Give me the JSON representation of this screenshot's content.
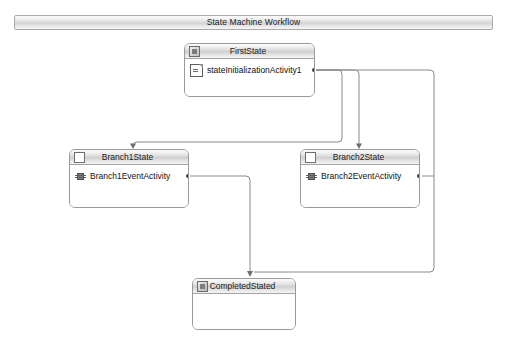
{
  "workflow": {
    "title": "State Machine Workflow",
    "designer_background": "#ffffff",
    "chrome_border": "#a9a9a9",
    "connector_color": "#8a8a8a"
  },
  "states": [
    {
      "id": "first-state",
      "name": "FirstState",
      "icon": "initial-state-icon",
      "x": 184,
      "y": 43,
      "width": 131,
      "height": 54,
      "activities": [
        {
          "id": "state-initialization-activity-1",
          "name": "stateInitializationActivity1",
          "icon": "state-initialization-icon"
        }
      ]
    },
    {
      "id": "branch1-state",
      "name": "Branch1State",
      "icon": "state-icon",
      "x": 69,
      "y": 149,
      "width": 120,
      "height": 59,
      "activities": [
        {
          "id": "branch1-event-activity",
          "name": "Branch1EventActivity",
          "icon": "event-driven-icon"
        }
      ]
    },
    {
      "id": "branch2-state",
      "name": "Branch2State",
      "icon": "state-icon",
      "x": 300,
      "y": 149,
      "width": 120,
      "height": 59,
      "activities": [
        {
          "id": "branch2-event-activity",
          "name": "Branch2EventActivity",
          "icon": "event-driven-icon"
        }
      ]
    },
    {
      "id": "completed-stated",
      "name": "CompletedStated",
      "icon": "completed-state-icon",
      "x": 192,
      "y": 278,
      "width": 104,
      "height": 52,
      "activities": []
    }
  ],
  "connectors": [
    {
      "id": "first-to-branch1",
      "from": "state-initialization-activity-1",
      "to": "branch1-state",
      "label": ""
    },
    {
      "id": "first-to-branch2",
      "from": "state-initialization-activity-1",
      "to": "branch2-state",
      "label": ""
    },
    {
      "id": "branch1-to-completed",
      "from": "branch1-event-activity",
      "to": "completed-stated",
      "label": ""
    },
    {
      "id": "branch2-to-completed",
      "from": "branch2-event-activity",
      "to": "completed-stated",
      "label": ""
    }
  ]
}
